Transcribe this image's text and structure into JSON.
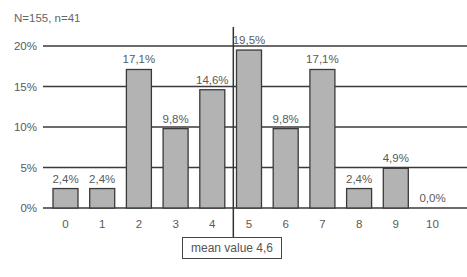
{
  "header": {
    "sample_note": "N=155, n=41"
  },
  "mean_label": "mean value 4,6",
  "colors": {
    "bar_fill": "#b3b3b3",
    "bar_stroke": "#3a3a3a",
    "grid": "#3a3a3a",
    "text": "#5a5a5a"
  },
  "chart_data": {
    "type": "bar",
    "title": "",
    "xlabel": "",
    "ylabel": "",
    "categories": [
      "0",
      "1",
      "2",
      "3",
      "4",
      "5",
      "6",
      "7",
      "8",
      "9",
      "10"
    ],
    "values": [
      2.4,
      2.4,
      17.1,
      9.8,
      14.6,
      19.5,
      9.8,
      17.1,
      2.4,
      4.9,
      0.0
    ],
    "value_labels": [
      "2,4%",
      "2,4%",
      "17,1%",
      "9,8%",
      "14,6%",
      "19,5%",
      "9,8%",
      "17,1%",
      "2,4%",
      "4,9%",
      "0,0%"
    ],
    "yticks": [
      "0%",
      "5%",
      "10%",
      "15%",
      "20%"
    ],
    "ylim": [
      0,
      20
    ],
    "grid": true,
    "legend": null,
    "annotations": [
      {
        "text": "N=155, n=41",
        "position": "top-left"
      },
      {
        "text": "mean value 4,6",
        "type": "vertical-line",
        "x": 4.6
      }
    ]
  }
}
